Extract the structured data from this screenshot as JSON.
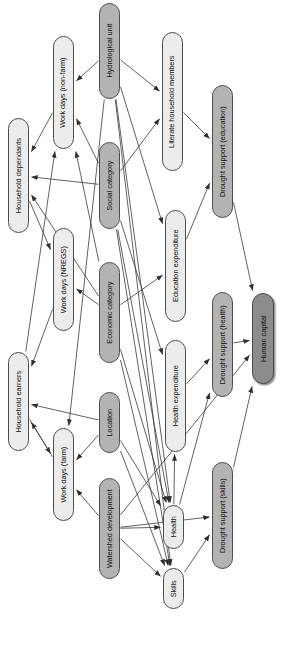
{
  "figure": {
    "orientation": "rotated-90",
    "background_color": "#ffffff",
    "edge_color": "#3a3a3a",
    "node_border_color": "#4d4d4d",
    "fill_colors": {
      "light": "#ececec",
      "mid": "#b3b3b3",
      "dark": "#8c8c8c"
    },
    "caption_fragment": ""
  },
  "nodes": [
    {
      "id": "hydrological_unit",
      "label": "Hydrological unit",
      "fill": "mid",
      "x": 99,
      "y": 3,
      "w": 21,
      "h": 96
    },
    {
      "id": "work_days_non_farm",
      "label": "Work days (non-farm)",
      "fill": "light",
      "x": 53,
      "y": 36,
      "w": 21,
      "h": 113
    },
    {
      "id": "literate_household_members",
      "label": "Literate household members",
      "fill": "light",
      "x": 162,
      "y": 32,
      "w": 21,
      "h": 139
    },
    {
      "id": "drought_support_education",
      "label": "Drought support (education)",
      "fill": "mid",
      "x": 212,
      "y": 85,
      "w": 21,
      "h": 133
    },
    {
      "id": "household_dependants",
      "label": "Household dependants",
      "fill": "light",
      "x": 8,
      "y": 118,
      "w": 21,
      "h": 115
    },
    {
      "id": "social_category",
      "label": "Social category",
      "fill": "mid",
      "x": 99,
      "y": 142,
      "w": 21,
      "h": 87
    },
    {
      "id": "work_days_nregs",
      "label": "Work days (NREGS)",
      "fill": "light",
      "x": 53,
      "y": 228,
      "w": 21,
      "h": 103
    },
    {
      "id": "education_expenditure",
      "label": "Education expenditure",
      "fill": "light",
      "x": 165,
      "y": 210,
      "w": 21,
      "h": 112
    },
    {
      "id": "economic_category",
      "label": "Economic category",
      "fill": "mid",
      "x": 99,
      "y": 262,
      "w": 21,
      "h": 101
    },
    {
      "id": "drought_support_health",
      "label": "Drought support (health)",
      "fill": "mid",
      "x": 212,
      "y": 292,
      "w": 21,
      "h": 105
    },
    {
      "id": "human_capital",
      "label": "Human capital",
      "fill": "dark",
      "x": 252,
      "y": 293,
      "w": 22,
      "h": 91
    },
    {
      "id": "household_earners",
      "label": "Household earners",
      "fill": "light",
      "x": 8,
      "y": 352,
      "w": 21,
      "h": 99
    },
    {
      "id": "health_expenditure",
      "label": "Health expenditure",
      "fill": "light",
      "x": 165,
      "y": 340,
      "w": 21,
      "h": 112
    },
    {
      "id": "location",
      "label": "Location",
      "fill": "mid",
      "x": 99,
      "y": 392,
      "w": 21,
      "h": 61
    },
    {
      "id": "work_days_farm",
      "label": "Work days (farm)",
      "fill": "light",
      "x": 53,
      "y": 428,
      "w": 21,
      "h": 93
    },
    {
      "id": "drought_support_skills",
      "label": "Drought support (skills)",
      "fill": "mid",
      "x": 212,
      "y": 462,
      "w": 21,
      "h": 107
    },
    {
      "id": "watershed_development",
      "label": "Watershed development",
      "fill": "mid",
      "x": 99,
      "y": 478,
      "w": 21,
      "h": 101
    },
    {
      "id": "health",
      "label": "Health",
      "fill": "light",
      "x": 163,
      "y": 505,
      "w": 21,
      "h": 44
    },
    {
      "id": "skills",
      "label": "Skills",
      "fill": "light",
      "x": 163,
      "y": 568,
      "w": 21,
      "h": 41
    }
  ],
  "edges": [
    {
      "from": "hydrological_unit",
      "to": "work_days_non_farm"
    },
    {
      "from": "hydrological_unit",
      "to": "literate_household_members"
    },
    {
      "from": "hydrological_unit",
      "to": "work_days_farm"
    },
    {
      "from": "hydrological_unit",
      "to": "health"
    },
    {
      "from": "hydrological_unit",
      "to": "skills"
    },
    {
      "from": "hydrological_unit",
      "to": "education_expenditure"
    },
    {
      "from": "social_category",
      "to": "household_dependants"
    },
    {
      "from": "social_category",
      "to": "work_days_non_farm"
    },
    {
      "from": "social_category",
      "to": "literate_household_members"
    },
    {
      "from": "social_category",
      "to": "health"
    },
    {
      "from": "social_category",
      "to": "skills"
    },
    {
      "from": "social_category",
      "to": "health_expenditure"
    },
    {
      "from": "economic_category",
      "to": "household_dependants"
    },
    {
      "from": "economic_category",
      "to": "work_days_non_farm"
    },
    {
      "from": "economic_category",
      "to": "work_days_nregs"
    },
    {
      "from": "economic_category",
      "to": "education_expenditure"
    },
    {
      "from": "economic_category",
      "to": "health"
    },
    {
      "from": "economic_category",
      "to": "skills"
    },
    {
      "from": "location",
      "to": "household_earners"
    },
    {
      "from": "location",
      "to": "work_days_farm"
    },
    {
      "from": "location",
      "to": "health"
    },
    {
      "from": "location",
      "to": "skills"
    },
    {
      "from": "watershed_development",
      "to": "work_days_farm"
    },
    {
      "from": "watershed_development",
      "to": "health"
    },
    {
      "from": "watershed_development",
      "to": "skills"
    },
    {
      "from": "watershed_development",
      "to": "drought_support_skills"
    },
    {
      "from": "watershed_development",
      "to": "human_capital"
    },
    {
      "from": "household_dependants",
      "to": "work_days_nregs"
    },
    {
      "from": "household_earners",
      "to": "work_days_farm"
    },
    {
      "from": "household_earners",
      "to": "work_days_non_farm"
    },
    {
      "from": "work_days_non_farm",
      "to": "household_dependants"
    },
    {
      "from": "work_days_nregs",
      "to": "household_earners"
    },
    {
      "from": "work_days_farm",
      "to": "household_earners"
    },
    {
      "from": "literate_household_members",
      "to": "drought_support_education"
    },
    {
      "from": "education_expenditure",
      "to": "drought_support_education"
    },
    {
      "from": "health_expenditure",
      "to": "drought_support_health"
    },
    {
      "from": "health",
      "to": "health_expenditure"
    },
    {
      "from": "health",
      "to": "drought_support_health"
    },
    {
      "from": "skills",
      "to": "drought_support_skills"
    },
    {
      "from": "drought_support_education",
      "to": "human_capital"
    },
    {
      "from": "drought_support_health",
      "to": "human_capital"
    },
    {
      "from": "drought_support_skills",
      "to": "human_capital"
    }
  ]
}
